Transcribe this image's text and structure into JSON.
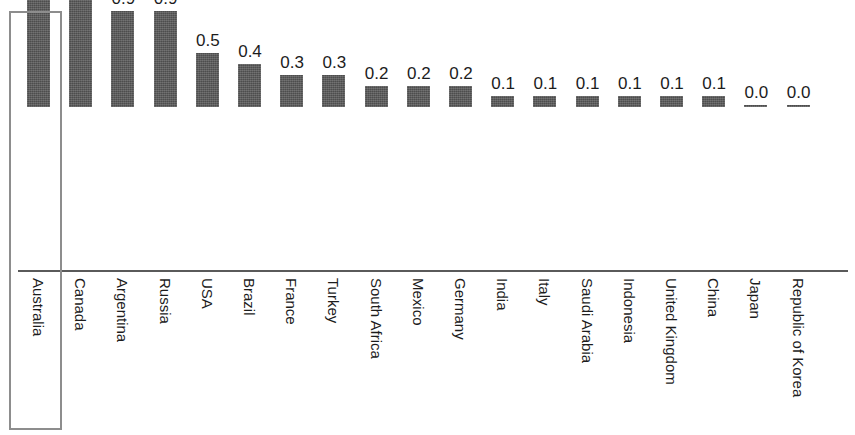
{
  "chart_data": {
    "type": "bar",
    "title": "",
    "subtitle": "",
    "xlabel": "",
    "ylabel": "",
    "ylim": [
      0,
      2.1
    ],
    "grid": false,
    "legend": null,
    "value_labels_shown": true,
    "categories": [
      "Australia",
      "Canada",
      "Argentina",
      "Russia",
      "USA",
      "Brazil",
      "France",
      "Turkey",
      "South Africa",
      "Mexico",
      "Germany",
      "India",
      "Italy",
      "Saudi Arabia",
      "Indonesia",
      "United Kingdom",
      "China",
      "Japan",
      "Republic of Korea"
    ],
    "values": [
      2.1,
      1.3,
      0.9,
      0.9,
      0.5,
      0.4,
      0.3,
      0.3,
      0.2,
      0.2,
      0.2,
      0.1,
      0.1,
      0.1,
      0.1,
      0.1,
      0.1,
      0.0,
      0.0
    ],
    "value_labels": [
      "2.1",
      "1.3",
      "0.9",
      "0.9",
      "0.5",
      "0.4",
      "0.3",
      "0.3",
      "0.2",
      "0.2",
      "0.2",
      "0.1",
      "0.1",
      "0.1",
      "0.1",
      "0.1",
      "0.1",
      "0.0",
      "0.0"
    ]
  },
  "style": {
    "bar_color": "#565656",
    "axis_color": "#5a5a5a",
    "text_color": "#1c1c1c",
    "background": "#ffffff",
    "highlight_border_color": "#8d8d8d"
  },
  "selection": {
    "highlighted_category": "Australia"
  }
}
